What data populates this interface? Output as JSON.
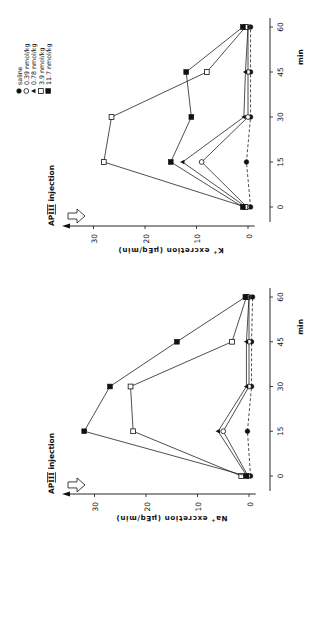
{
  "figure": {
    "time_unit": "min",
    "injection_label": "AP III injection",
    "legend": [
      {
        "marker": "filled-circle",
        "label": "saline"
      },
      {
        "marker": "open-circle",
        "label": "0.39 nmol/kg"
      },
      {
        "marker": "filled-triangle",
        "label": "0.78 nmol/kg"
      },
      {
        "marker": "open-square",
        "label": "3.9 nmol/kg"
      },
      {
        "marker": "filled-square",
        "label": "11.7 nmol/kg"
      }
    ]
  },
  "chart_data": [
    {
      "type": "line",
      "title": "",
      "xlabel": "min",
      "ylabel": "K+ excretion (µEq/min)",
      "annotation": "AP III injection",
      "x": [
        0,
        15,
        30,
        45,
        60
      ],
      "xticks": [
        0,
        15,
        30,
        45,
        60
      ],
      "yticks": [
        0,
        10,
        20,
        30
      ],
      "ylim": [
        -1,
        33
      ],
      "grid": false,
      "legend_position": "top-right (rotated figure)",
      "series": [
        {
          "name": "saline",
          "marker": "filled-circle",
          "dashed": true,
          "values": [
            -0.5,
            0.3,
            -0.5,
            -0.5,
            -0.5
          ]
        },
        {
          "name": "0.39 nmol/kg",
          "marker": "open-circle",
          "dashed": false,
          "values": [
            0.2,
            9,
            0,
            0,
            0
          ]
        },
        {
          "name": "0.78 nmol/kg",
          "marker": "filled-triangle",
          "dashed": false,
          "values": [
            0.4,
            12.7,
            0.8,
            0.5,
            0
          ]
        },
        {
          "name": "3.9 nmol/kg",
          "marker": "open-square",
          "dashed": false,
          "values": [
            0.5,
            28,
            26.5,
            8,
            0.5
          ]
        },
        {
          "name": "11.7 nmol/kg",
          "marker": "filled-square",
          "dashed": false,
          "values": [
            1,
            15,
            11,
            12,
            1
          ]
        }
      ]
    },
    {
      "type": "line",
      "title": "",
      "xlabel": "min",
      "ylabel": "Na+ excretion (µEq/min)",
      "annotation": "AP III injection",
      "x": [
        0,
        15,
        30,
        45,
        60
      ],
      "xticks": [
        0,
        15,
        30,
        45,
        60
      ],
      "yticks": [
        0,
        10,
        20,
        30
      ],
      "ylim": [
        -1,
        34
      ],
      "grid": false,
      "series": [
        {
          "name": "saline",
          "marker": "filled-circle",
          "dashed": true,
          "values": [
            -0.3,
            0.3,
            -0.5,
            -0.5,
            -0.7
          ]
        },
        {
          "name": "0.39 nmol/kg",
          "marker": "open-circle",
          "dashed": false,
          "values": [
            0.2,
            5,
            0,
            0,
            0
          ]
        },
        {
          "name": "0.78 nmol/kg",
          "marker": "filled-triangle",
          "dashed": false,
          "values": [
            0.4,
            6,
            0.5,
            0.5,
            0
          ]
        },
        {
          "name": "3.9 nmol/kg",
          "marker": "open-square",
          "dashed": false,
          "values": [
            1.5,
            22.5,
            23,
            3.3,
            0.5
          ]
        },
        {
          "name": "11.7 nmol/kg",
          "marker": "filled-square",
          "dashed": false,
          "values": [
            0.5,
            32,
            27,
            14,
            0.7
          ]
        }
      ]
    }
  ],
  "labels": {
    "k_ylabel_main": "K",
    "k_ylabel_sup": "+",
    "k_ylabel_rest": " excretion (µEq/min)",
    "na_ylabel_main": "Na",
    "na_ylabel_sup": "+",
    "na_ylabel_rest": " excretion (µEq/min)",
    "ap": "AP",
    "roman": "III",
    "injection": " injection",
    "min": "min"
  }
}
